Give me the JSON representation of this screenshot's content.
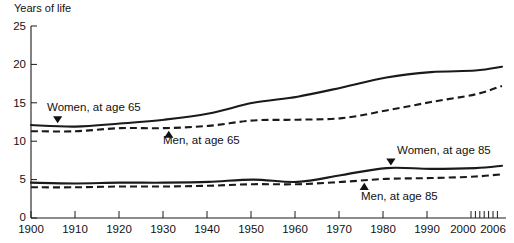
{
  "chart_data": {
    "type": "line",
    "title": "",
    "subtitle": "",
    "ylabel": "Years of life",
    "xlabel": "",
    "xlim": [
      1900,
      2006
    ],
    "ylim": [
      0,
      25
    ],
    "grid": false,
    "legend_position": "inline-annotations",
    "y_ticks": [
      "0",
      "5",
      "10",
      "15",
      "20",
      "25"
    ],
    "y_tick_values": [
      0,
      5,
      10,
      15,
      20,
      25
    ],
    "x_ticks": [
      "1900",
      "1910",
      "1920",
      "1930",
      "1940",
      "1950",
      "1960",
      "1970",
      "1980",
      "1990",
      "2000",
      "2006"
    ],
    "x_tick_values": [
      1900,
      1910,
      1920,
      1930,
      1940,
      1950,
      1960,
      1970,
      1980,
      1990,
      2000,
      2006
    ],
    "x_minor_ticks": [
      2001,
      2002,
      2003,
      2004,
      2005,
      2006
    ],
    "x": [
      1900,
      1910,
      1920,
      1930,
      1940,
      1950,
      1960,
      1970,
      1980,
      1990,
      2000,
      2006
    ],
    "series": [
      {
        "name": "Women, at age 65",
        "style": "solid",
        "color": "#1a1a1a",
        "values": [
          12.1,
          11.9,
          12.3,
          12.8,
          13.6,
          15.0,
          15.8,
          17.0,
          18.3,
          19.0,
          19.2,
          19.7
        ]
      },
      {
        "name": "Men, at age 65",
        "style": "dashed",
        "color": "#1a1a1a",
        "values": [
          11.3,
          11.3,
          11.7,
          11.7,
          12.0,
          12.7,
          12.8,
          13.0,
          14.0,
          15.1,
          16.1,
          17.2
        ]
      },
      {
        "name": "Women, at age 85",
        "style": "solid",
        "color": "#1a1a1a",
        "values": [
          4.6,
          4.5,
          4.6,
          4.6,
          4.7,
          5.0,
          4.7,
          5.6,
          6.5,
          6.4,
          6.5,
          6.8
        ]
      },
      {
        "name": "Men, at age 85",
        "style": "dashed",
        "color": "#1a1a1a",
        "values": [
          4.0,
          4.0,
          4.1,
          4.1,
          4.2,
          4.4,
          4.4,
          4.7,
          5.1,
          5.2,
          5.4,
          5.7
        ]
      }
    ],
    "annotations": [
      {
        "text": "Women, at age 65",
        "marker": "triangle-down",
        "target_year": 1906,
        "target_value": 12.0
      },
      {
        "text": "Men, at age 65",
        "marker": "triangle-up",
        "target_year": 1931,
        "target_value": 11.7
      },
      {
        "text": "Women, at age 85",
        "marker": "triangle-down",
        "target_year": 1981,
        "target_value": 6.5
      },
      {
        "text": "Men, at age 85",
        "marker": "triangle-up",
        "target_year": 1975,
        "target_value": 4.9
      }
    ]
  }
}
